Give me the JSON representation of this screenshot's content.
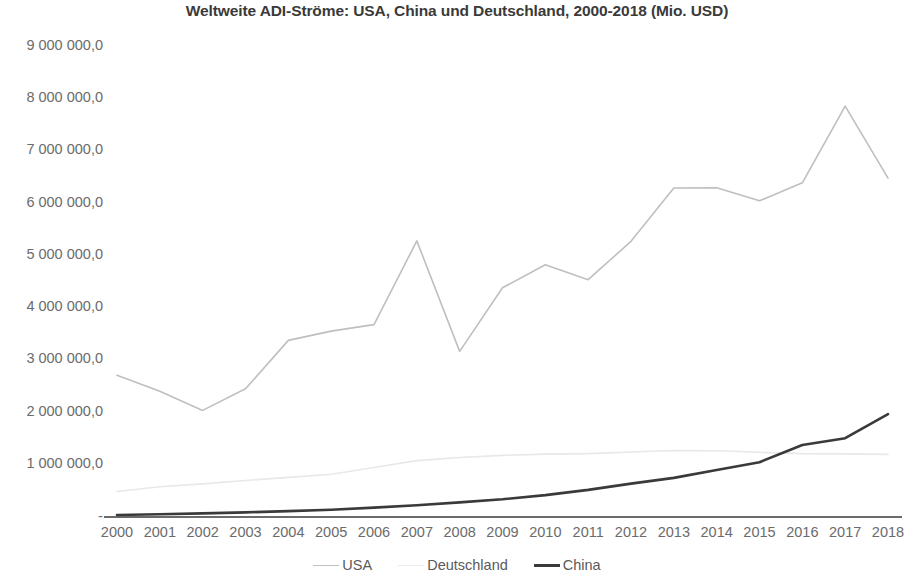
{
  "chart_data": {
    "type": "line",
    "title": "Weltweite ADI-Ströme: USA, China und Deutschland, 2000-2018 (Mio. USD)",
    "xlabel": "",
    "ylabel": "",
    "grid": false,
    "legend_position": "bottom",
    "ylim": [
      0,
      9000000
    ],
    "ytick_values": [
      0,
      1000000,
      2000000,
      3000000,
      4000000,
      5000000,
      6000000,
      7000000,
      8000000,
      9000000
    ],
    "ytick_labels": [
      "-",
      "1 000 000,0",
      "2 000 000,0",
      "3 000 000,0",
      "4 000 000,0",
      "5 000 000,0",
      "6 000 000,0",
      "7 000 000,0",
      "8 000 000,0",
      "9 000 000,0"
    ],
    "categories": [
      "2000",
      "2001",
      "2002",
      "2003",
      "2004",
      "2005",
      "2006",
      "2007",
      "2008",
      "2009",
      "2010",
      "2011",
      "2012",
      "2013",
      "2014",
      "2015",
      "2016",
      "2017",
      "2018"
    ],
    "series": [
      {
        "name": "USA",
        "color": "#bfbfbf",
        "width": 1.6,
        "values": [
          2694000,
          2390000,
          2022000,
          2436000,
          3363000,
          3540000,
          3664000,
          5268000,
          3153000,
          4370000,
          4810000,
          4525000,
          5260000,
          6280000,
          6285000,
          6035000,
          6380000,
          7850000,
          6470000
        ]
      },
      {
        "name": "Deutschland",
        "color": "#e8e8e8",
        "width": 1.6,
        "values": [
          470000,
          560000,
          615000,
          680000,
          740000,
          800000,
          930000,
          1060000,
          1120000,
          1160000,
          1185000,
          1195000,
          1225000,
          1255000,
          1250000,
          1220000,
          1195000,
          1190000,
          1180000
        ]
      },
      {
        "name": "China",
        "color": "#3a3a3a",
        "width": 2.6,
        "values": [
          20000,
          34000,
          50000,
          70000,
          93000,
          120000,
          160000,
          205000,
          260000,
          320000,
          400000,
          500000,
          620000,
          730000,
          880000,
          1030000,
          1360000,
          1490000,
          1950000
        ]
      }
    ]
  },
  "legend": {
    "items": [
      {
        "label": "USA",
        "color": "#bfbfbf",
        "width": 1.8
      },
      {
        "label": "Deutschland",
        "color": "#ededed",
        "width": 1.8
      },
      {
        "label": "China",
        "color": "#3a3a3a",
        "width": 3
      }
    ]
  },
  "axes": {
    "baseline_color": "#3a3a3a",
    "text_color": "#6b6b6b"
  }
}
